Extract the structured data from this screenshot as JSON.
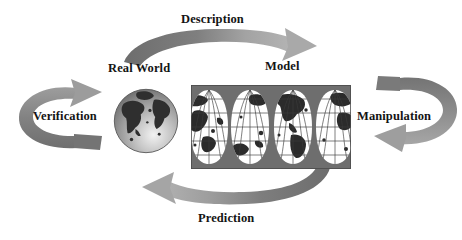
{
  "diagram": {
    "nodes": [
      {
        "id": "real-world",
        "label": "Real World",
        "icon": "globe-sphere-icon"
      },
      {
        "id": "model",
        "label": "Model",
        "icon": "world-map-interrupted-projection-icon"
      }
    ],
    "arrows": [
      {
        "id": "description",
        "label": "Description",
        "from": "real-world",
        "to": "model",
        "position": "top",
        "direction": "left-to-right"
      },
      {
        "id": "manipulation",
        "label": "Manipulation",
        "from": "model",
        "to": "model",
        "position": "right",
        "direction": "clockwise-down"
      },
      {
        "id": "prediction",
        "label": "Prediction",
        "from": "model",
        "to": "real-world",
        "position": "bottom",
        "direction": "right-to-left"
      },
      {
        "id": "verification",
        "label": "Verification",
        "from": "real-world",
        "to": "real-world",
        "position": "left",
        "direction": "counter-clockwise-up"
      }
    ],
    "colors": {
      "arrow_dark": "#6e6e6e",
      "arrow_light": "#b4b4b4",
      "map_background": "#6e6e6e",
      "map_land": "#2b2b2b",
      "map_ocean": "#ffffff",
      "globe_ocean": "#9a9a9a",
      "globe_land": "#2f2f2f",
      "text": "#141414",
      "page_background": "#ffffff"
    }
  }
}
